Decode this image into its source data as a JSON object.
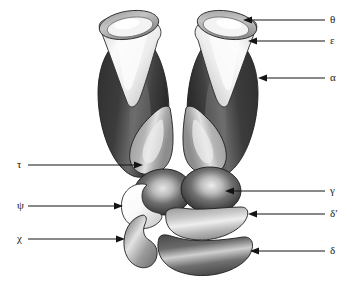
{
  "figure": {
    "background_color": "#ffffff",
    "outline_color": "#1a1a1a"
  },
  "palette": {
    "very_dark": "#3a3a3a",
    "dark": "#4a4a4a",
    "mid_dark": "#6e6e6e",
    "mid": "#8f8f8f",
    "mid_light": "#a8a8a8",
    "light": "#c9c9c9",
    "very_light": "#e8e8e8",
    "white": "#f7f7f7",
    "highlight": "#ededed"
  },
  "labels": [
    {
      "id": "theta",
      "text": "θ",
      "x": 330,
      "y": 16,
      "arrow_from_x": 325,
      "arrow_from_y": 20,
      "arrow_to_x": 243,
      "arrow_to_y": 20,
      "side": "right"
    },
    {
      "id": "epsilon",
      "text": "ε",
      "x": 330,
      "y": 38,
      "arrow_from_x": 325,
      "arrow_from_y": 41,
      "arrow_to_x": 248,
      "arrow_to_y": 41,
      "side": "right"
    },
    {
      "id": "alpha",
      "text": "α",
      "x": 330,
      "y": 75,
      "arrow_from_x": 325,
      "arrow_from_y": 78,
      "arrow_to_x": 258,
      "arrow_to_y": 78,
      "side": "right"
    },
    {
      "id": "gamma",
      "text": "γ",
      "x": 330,
      "y": 188,
      "arrow_from_x": 325,
      "arrow_from_y": 191,
      "arrow_to_x": 225,
      "arrow_to_y": 191,
      "side": "right"
    },
    {
      "id": "delta_prime",
      "text": "δ′",
      "x": 330,
      "y": 211,
      "arrow_from_x": 325,
      "arrow_from_y": 214,
      "arrow_to_x": 248,
      "arrow_to_y": 214,
      "side": "right"
    },
    {
      "id": "delta",
      "text": "δ",
      "x": 330,
      "y": 248,
      "arrow_from_x": 325,
      "arrow_from_y": 251,
      "arrow_to_x": 250,
      "arrow_to_y": 251,
      "side": "right"
    },
    {
      "id": "tau",
      "text": "τ",
      "x": 18,
      "y": 160,
      "arrow_from_x": 28,
      "arrow_from_y": 165,
      "arrow_to_x": 143,
      "arrow_to_y": 165,
      "side": "left"
    },
    {
      "id": "psi",
      "text": "ψ",
      "x": 18,
      "y": 202,
      "arrow_from_x": 28,
      "arrow_from_y": 206,
      "arrow_to_x": 123,
      "arrow_to_y": 206,
      "side": "left"
    },
    {
      "id": "chi",
      "text": "χ",
      "x": 18,
      "y": 236,
      "arrow_from_x": 28,
      "arrow_from_y": 239,
      "arrow_to_x": 125,
      "arrow_to_y": 239,
      "side": "left"
    }
  ],
  "subunits": [
    {
      "id": "alpha-left",
      "label_ref": "alpha",
      "shape": "elongated-lobe",
      "fill": "#3f3f3f"
    },
    {
      "id": "alpha-right",
      "label_ref": "alpha",
      "shape": "elongated-lobe",
      "fill": "#3f3f3f"
    },
    {
      "id": "epsilon-left",
      "label_ref": "epsilon",
      "shape": "cone-cap",
      "fill": "#efefef"
    },
    {
      "id": "epsilon-right",
      "label_ref": "epsilon",
      "shape": "cone-cap",
      "fill": "#efefef"
    },
    {
      "id": "theta-left",
      "label_ref": "theta",
      "shape": "ellipse-rim",
      "fill": "#b5b5b5"
    },
    {
      "id": "theta-right",
      "label_ref": "theta",
      "shape": "ellipse-rim",
      "fill": "#b5b5b5"
    },
    {
      "id": "tau-left",
      "label_ref": "tau",
      "shape": "teardrop",
      "fill": "#a5a5a5"
    },
    {
      "id": "tau-right",
      "label_ref": "tau",
      "shape": "teardrop",
      "fill": "#a5a5a5"
    },
    {
      "id": "gamma-left",
      "label_ref": "gamma",
      "shape": "round-lobe",
      "fill": "#3f3f3f"
    },
    {
      "id": "gamma-right",
      "label_ref": "gamma",
      "shape": "round-lobe",
      "fill": "#3f3f3f"
    },
    {
      "id": "psi-subunit",
      "label_ref": "psi",
      "shape": "crescent",
      "fill": "#f5f5f5"
    },
    {
      "id": "chi-subunit",
      "label_ref": "chi",
      "shape": "crescent",
      "fill": "#909090"
    },
    {
      "id": "delta-prime-subunit",
      "label_ref": "delta_prime",
      "shape": "banana",
      "fill": "#b0b0b0"
    },
    {
      "id": "delta-subunit",
      "label_ref": "delta",
      "shape": "banana",
      "fill": "#5a5a5a"
    }
  ]
}
